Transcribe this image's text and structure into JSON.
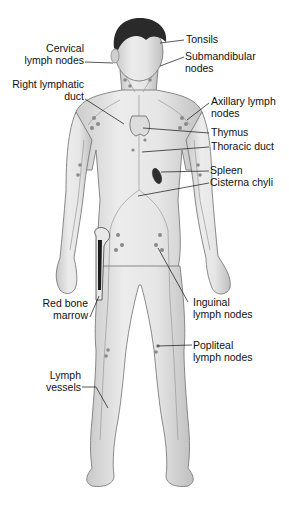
{
  "diagram": {
    "figure": "Front view of standing male figure with lymph nodes, vessels and organs",
    "colors": {
      "background": "#ffffff",
      "skin": "#e2e2e2",
      "skin_shadow": "#bdbdbd",
      "outline": "#6e6e6e",
      "hair": "#2a2a2a",
      "node": "#8a8a8a",
      "vessel": "#9a9a9a",
      "bone_marrow": "#1c1c1c",
      "leader_line": "#111111",
      "label_text": "#111111"
    },
    "labels_left": [
      {
        "id": "cervical",
        "line1": "Cervical",
        "line2": "lymph nodes"
      },
      {
        "id": "right-lymphatic-duct",
        "line1": "Right lymphatic",
        "line2": "duct"
      },
      {
        "id": "red-bone-marrow",
        "line1": "Red bone",
        "line2": "marrow"
      },
      {
        "id": "lymph-vessels",
        "line1": "Lymph",
        "line2": "vessels"
      }
    ],
    "labels_right": [
      {
        "id": "tonsils",
        "line1": "Tonsils",
        "line2": ""
      },
      {
        "id": "submandibular",
        "line1": "Submandibular",
        "line2": "nodes"
      },
      {
        "id": "axillary",
        "line1": "Axillary lymph",
        "line2": "nodes"
      },
      {
        "id": "thymus",
        "line1": "Thymus",
        "line2": ""
      },
      {
        "id": "thoracic-duct",
        "line1": "Thoracic duct",
        "line2": ""
      },
      {
        "id": "spleen",
        "line1": "Spleen",
        "line2": ""
      },
      {
        "id": "cisterna-chyli",
        "line1": "Cisterna chyli",
        "line2": ""
      },
      {
        "id": "inguinal",
        "line1": "Inguinal",
        "line2": "lymph nodes"
      },
      {
        "id": "popliteal",
        "line1": "Popliteal",
        "line2": "lymph nodes"
      }
    ]
  }
}
